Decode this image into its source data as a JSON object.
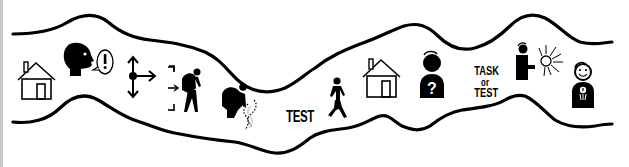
{
  "diagram": {
    "type": "journey-path",
    "colors": {
      "stroke": "#000000",
      "background": "#ffffff",
      "dotted_trail": "#d8d8d8"
    },
    "steps": [
      {
        "icon": "house-icon",
        "name": "home-start"
      },
      {
        "icon": "speaking-head-exclamation-icon",
        "name": "alert-announcement"
      },
      {
        "icon": "direction-arrows-icon",
        "name": "choose-direction"
      },
      {
        "icon": "hiker-entering-icon",
        "name": "traveler-entering"
      },
      {
        "icon": "hiker-searching-icon",
        "name": "traveler-searching-trail"
      },
      {
        "icon": "test-text",
        "name": "test",
        "label": "TEST"
      },
      {
        "icon": "walking-person-icon",
        "name": "walking"
      },
      {
        "icon": "house-icon",
        "name": "home-return"
      },
      {
        "icon": "person-question-icon",
        "name": "person-questioning"
      },
      {
        "icon": "task-or-test-text",
        "name": "task-or-test",
        "lines": [
          "TASK",
          "or",
          "TEST"
        ]
      },
      {
        "icon": "person-holding-sun-icon",
        "name": "person-holding-light"
      },
      {
        "icon": "smiling-person-medal-icon",
        "name": "rewarded-person"
      }
    ]
  }
}
